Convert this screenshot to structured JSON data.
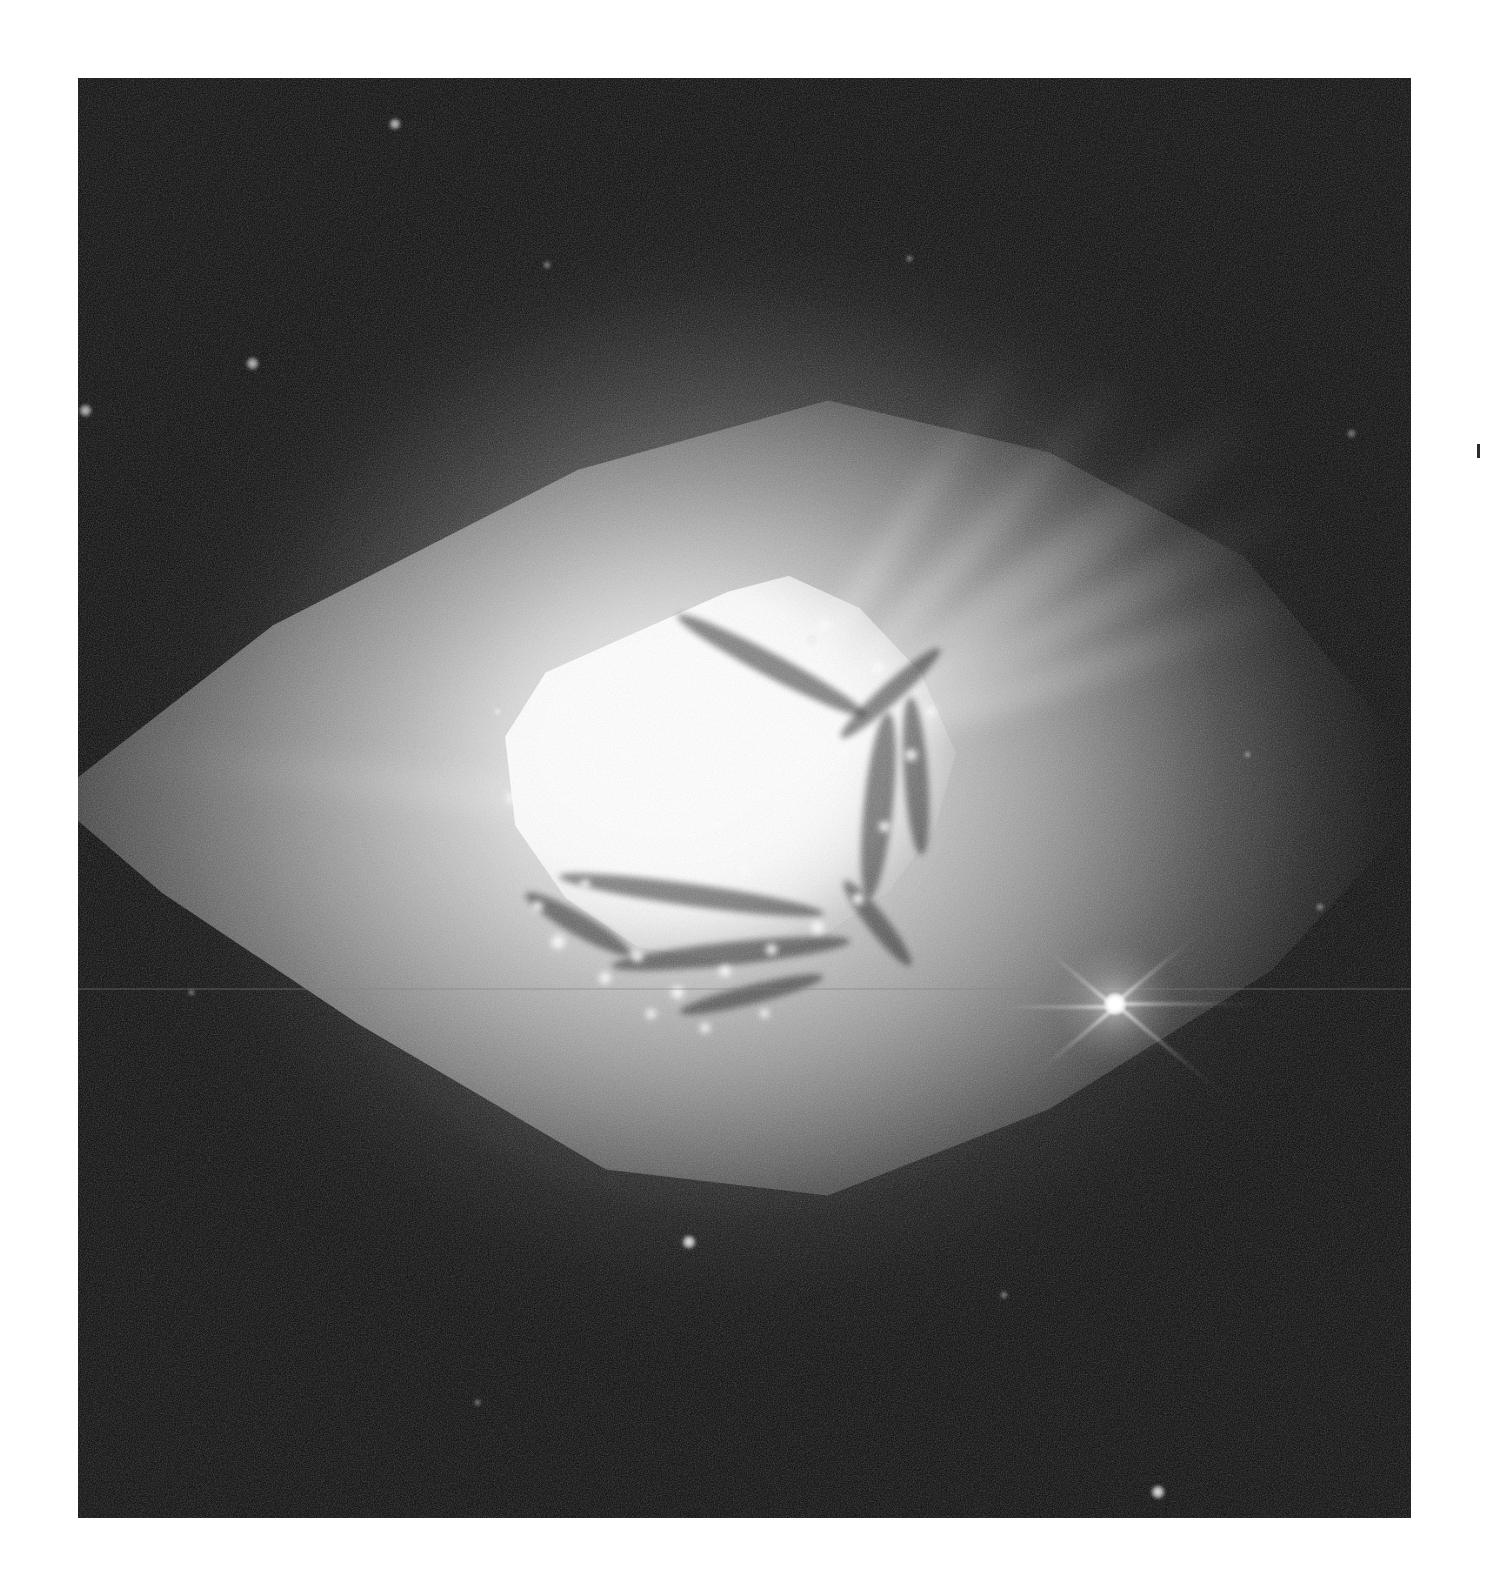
{
  "page": {
    "background_color": "#ffffff",
    "width": 1487,
    "height": 1596,
    "caption": ""
  },
  "plate": {
    "name": "astronomical-plate",
    "kind": "grayscale-telescope-image",
    "subject": "planetary-nebula",
    "left": 78,
    "top": 78,
    "width": 1333,
    "height": 1440,
    "sky_background_color": "#070707",
    "core_color": "#ffffff",
    "halo_color": "#8a8a8a",
    "lens_color": "#c4c4c4",
    "orientation_note": ""
  },
  "features": {
    "core": {
      "label": "bright-inner-core",
      "center_x_pct": 48,
      "center_y_pct": 48,
      "width_pct": 38,
      "height_pct": 28,
      "peak_brightness": "saturated-white"
    },
    "lens_envelope": {
      "label": "diamond-lens-envelope",
      "shape": "lens/diamond",
      "long_axis": "east-west",
      "brightness": "medium-gray"
    },
    "halo": {
      "label": "faint-round-halo",
      "shape": "circular",
      "brightness": "very-faint-gray"
    },
    "rays": {
      "label": "polar-rays",
      "count": 6,
      "direction": "upper-right"
    },
    "scanline": {
      "label": "horizontal-artifact",
      "y_pct": 63.2
    }
  },
  "stars": [
    {
      "name": "field-star-bright",
      "x_pct": 77.8,
      "y_pct": 64.3,
      "size": 22,
      "spikes": 6,
      "brightness": "very-bright"
    },
    {
      "name": "field-star-a",
      "x_pct": 23.8,
      "y_pct": 3.2,
      "size": 12,
      "brightness": "faint"
    },
    {
      "name": "field-star-b",
      "x_pct": 13.1,
      "y_pct": 19.8,
      "size": 13,
      "brightness": "faint"
    },
    {
      "name": "field-star-c",
      "x_pct": 0.6,
      "y_pct": 23.1,
      "size": 13,
      "brightness": "faint"
    },
    {
      "name": "field-star-d",
      "x_pct": 45.8,
      "y_pct": 80.8,
      "size": 14,
      "brightness": "moderate"
    },
    {
      "name": "field-star-e",
      "x_pct": 81.0,
      "y_pct": 98.2,
      "size": 14,
      "brightness": "moderate"
    },
    {
      "name": "field-star-f",
      "x_pct": 95.5,
      "y_pct": 24.7,
      "size": 9,
      "brightness": "very-faint"
    },
    {
      "name": "field-star-g",
      "x_pct": 93.2,
      "y_pct": 57.6,
      "size": 8,
      "brightness": "very-faint"
    },
    {
      "name": "field-star-h",
      "x_pct": 87.7,
      "y_pct": 47.0,
      "size": 7,
      "brightness": "very-faint"
    },
    {
      "name": "field-star-i",
      "x_pct": 35.2,
      "y_pct": 13.0,
      "size": 8,
      "brightness": "very-faint"
    },
    {
      "name": "field-star-j",
      "x_pct": 62.4,
      "y_pct": 12.5,
      "size": 7,
      "brightness": "very-faint"
    },
    {
      "name": "field-star-k",
      "x_pct": 8.5,
      "y_pct": 63.5,
      "size": 7,
      "brightness": "very-faint"
    },
    {
      "name": "field-star-l",
      "x_pct": 30.0,
      "y_pct": 92.0,
      "size": 7,
      "brightness": "very-faint"
    },
    {
      "name": "field-star-m",
      "x_pct": 69.5,
      "y_pct": 84.5,
      "size": 8,
      "brightness": "very-faint"
    },
    {
      "name": "field-star-n",
      "x_pct": 55.0,
      "y_pct": 39.0,
      "size": 9,
      "brightness": "faint"
    },
    {
      "name": "field-star-o",
      "x_pct": 31.5,
      "y_pct": 44.0,
      "size": 9,
      "brightness": "faint"
    }
  ],
  "dark_lanes": [
    {
      "name": "lane-upper-diagonal",
      "x_pct": 44,
      "y_pct": 40,
      "w_pct": 16,
      "h_pct": 1.6,
      "rot": 28
    },
    {
      "name": "lane-upper-right-v",
      "x_pct": 56,
      "y_pct": 42,
      "w_pct": 10,
      "h_pct": 1.4,
      "rot": -42
    },
    {
      "name": "lane-right-vertical",
      "x_pct": 59,
      "y_pct": 44,
      "w_pct": 2.2,
      "h_pct": 13,
      "rot": 6
    },
    {
      "name": "lane-right-vertical-2",
      "x_pct": 62,
      "y_pct": 43,
      "w_pct": 1.8,
      "h_pct": 11,
      "rot": -4
    },
    {
      "name": "lane-mid-horizontal",
      "x_pct": 36,
      "y_pct": 56,
      "w_pct": 20,
      "h_pct": 1.5,
      "rot": 8
    },
    {
      "name": "lane-lower-arc",
      "x_pct": 40,
      "y_pct": 60,
      "w_pct": 18,
      "h_pct": 1.6,
      "rot": -6
    },
    {
      "name": "lane-lower-left",
      "x_pct": 33,
      "y_pct": 58,
      "w_pct": 9,
      "h_pct": 1.5,
      "rot": 30
    },
    {
      "name": "lane-lower-right",
      "x_pct": 56,
      "y_pct": 58,
      "w_pct": 8,
      "h_pct": 1.4,
      "rot": 52
    },
    {
      "name": "lane-bottom-mid",
      "x_pct": 45,
      "y_pct": 63,
      "w_pct": 11,
      "h_pct": 1.3,
      "rot": -14
    }
  ],
  "knots": [
    {
      "name": "knot-1",
      "x_pct": 36.0,
      "y_pct": 60.0,
      "size": 14
    },
    {
      "name": "knot-2",
      "x_pct": 39.5,
      "y_pct": 62.5,
      "size": 12
    },
    {
      "name": "knot-3",
      "x_pct": 42.0,
      "y_pct": 61.0,
      "size": 11
    },
    {
      "name": "knot-4",
      "x_pct": 45.0,
      "y_pct": 63.5,
      "size": 13
    },
    {
      "name": "knot-5",
      "x_pct": 48.5,
      "y_pct": 62.0,
      "size": 12
    },
    {
      "name": "knot-6",
      "x_pct": 52.0,
      "y_pct": 60.5,
      "size": 11
    },
    {
      "name": "knot-7",
      "x_pct": 55.5,
      "y_pct": 59.0,
      "size": 13
    },
    {
      "name": "knot-8",
      "x_pct": 58.5,
      "y_pct": 57.0,
      "size": 12
    },
    {
      "name": "knot-9",
      "x_pct": 34.5,
      "y_pct": 57.5,
      "size": 11
    },
    {
      "name": "knot-10",
      "x_pct": 38.0,
      "y_pct": 56.0,
      "size": 10
    },
    {
      "name": "knot-11",
      "x_pct": 50.0,
      "y_pct": 55.0,
      "size": 12
    },
    {
      "name": "knot-12",
      "x_pct": 60.5,
      "y_pct": 52.0,
      "size": 11
    },
    {
      "name": "knot-13",
      "x_pct": 62.5,
      "y_pct": 47.0,
      "size": 12
    },
    {
      "name": "knot-14",
      "x_pct": 60.0,
      "y_pct": 41.0,
      "size": 12
    },
    {
      "name": "knot-15",
      "x_pct": 56.0,
      "y_pct": 38.0,
      "size": 11
    },
    {
      "name": "knot-16",
      "x_pct": 43.0,
      "y_pct": 65.0,
      "size": 10
    },
    {
      "name": "knot-17",
      "x_pct": 47.0,
      "y_pct": 66.0,
      "size": 10
    },
    {
      "name": "knot-18",
      "x_pct": 51.5,
      "y_pct": 65.0,
      "size": 9
    },
    {
      "name": "knot-19",
      "x_pct": 32.5,
      "y_pct": 50.0,
      "size": 10
    },
    {
      "name": "knot-20",
      "x_pct": 64.0,
      "y_pct": 44.0,
      "size": 10
    }
  ],
  "spikes": [
    {
      "name": "spike-right",
      "angle": 0,
      "length": 150
    },
    {
      "name": "spike-left",
      "angle": 180,
      "length": 150
    },
    {
      "name": "spike-ne",
      "angle": -40,
      "length": 120
    },
    {
      "name": "spike-sw",
      "angle": 140,
      "length": 120
    },
    {
      "name": "spike-nw",
      "angle": -140,
      "length": 115
    },
    {
      "name": "spike-se",
      "angle": 40,
      "length": 135
    }
  ],
  "margin": {
    "tick_mark_label": "registration-tick"
  }
}
